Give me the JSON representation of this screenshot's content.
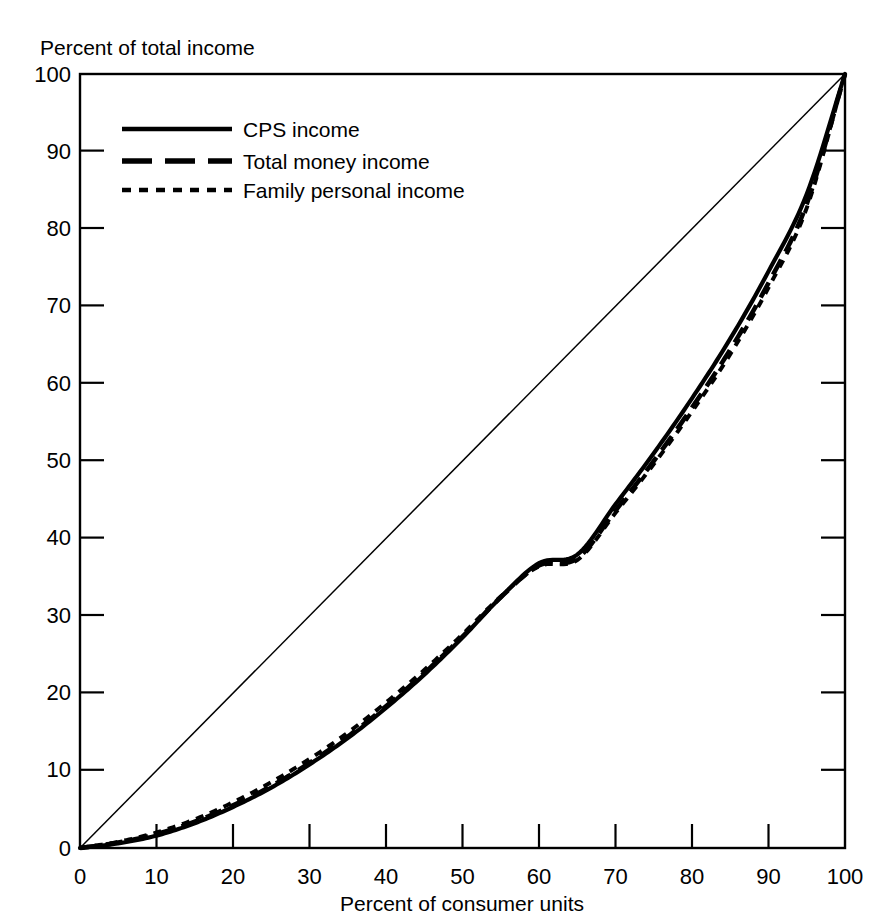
{
  "chart_data": {
    "type": "line",
    "title": "",
    "ylabel": "Percent of total income",
    "xlabel": "Percent of consumer units",
    "xlim": [
      0,
      100
    ],
    "ylim": [
      0,
      100
    ],
    "grid": false,
    "legend_position": "upper-left",
    "x_ticks": [
      "0",
      "10",
      "20",
      "30",
      "40",
      "50",
      "60",
      "70",
      "80",
      "90",
      "100"
    ],
    "y_ticks": [
      "0",
      "10",
      "20",
      "30",
      "40",
      "50",
      "60",
      "70",
      "80",
      "90",
      "100"
    ],
    "reference_line": {
      "name": "line of equality",
      "x": [
        0,
        100
      ],
      "y": [
        0,
        100
      ]
    },
    "x": [
      0,
      5,
      10,
      15,
      20,
      25,
      30,
      35,
      40,
      45,
      50,
      55,
      60,
      65,
      70,
      75,
      80,
      85,
      90,
      95,
      100
    ],
    "series": [
      {
        "name": "CPS income",
        "style": "solid",
        "values": [
          0.0,
          0.6,
          1.6,
          3.2,
          5.3,
          7.8,
          10.8,
          14.2,
          18.1,
          22.4,
          27.2,
          32.4,
          36.8,
          37.9,
          44.4,
          51.0,
          58.1,
          65.8,
          74.5,
          84.5,
          100.0
        ]
      },
      {
        "name": "Total money income",
        "style": "long-dash",
        "values": [
          0.0,
          0.7,
          1.8,
          3.4,
          5.5,
          8.0,
          11.0,
          14.4,
          18.3,
          22.6,
          27.3,
          32.4,
          36.5,
          37.4,
          43.6,
          50.0,
          56.9,
          64.4,
          73.0,
          83.2,
          100.0
        ]
      },
      {
        "name": "Family personal income",
        "style": "short-dash",
        "values": [
          0.0,
          0.8,
          2.0,
          3.7,
          5.9,
          8.5,
          11.5,
          14.9,
          18.8,
          23.0,
          27.6,
          32.5,
          36.4,
          37.2,
          43.3,
          49.6,
          56.4,
          63.8,
          72.4,
          82.7,
          100.0
        ]
      }
    ],
    "legend": [
      {
        "label": "CPS income",
        "style": "solid"
      },
      {
        "label": "Total money income",
        "style": "long-dash"
      },
      {
        "label": "Family personal income",
        "style": "short-dash"
      }
    ]
  }
}
